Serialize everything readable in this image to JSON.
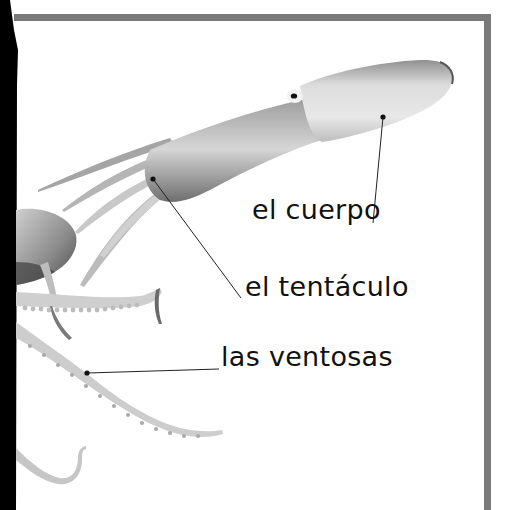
{
  "page": {
    "type": "labeled-diagram",
    "frame_color": "#7a7a7a",
    "background": "#ffffff"
  },
  "labels": [
    {
      "id": "cuerpo",
      "text": "el cuerpo",
      "pointer": {
        "from": [
          383,
          117
        ],
        "to": [
          373,
          223
        ]
      }
    },
    {
      "id": "tentaculo",
      "text": "el tentáculo",
      "pointer": {
        "from": [
          153,
          179
        ],
        "to": [
          241,
          298
        ]
      }
    },
    {
      "id": "ventosas",
      "text": "las ventosas",
      "pointer": {
        "from": [
          87,
          373
        ],
        "to": [
          219,
          369
        ]
      }
    }
  ]
}
